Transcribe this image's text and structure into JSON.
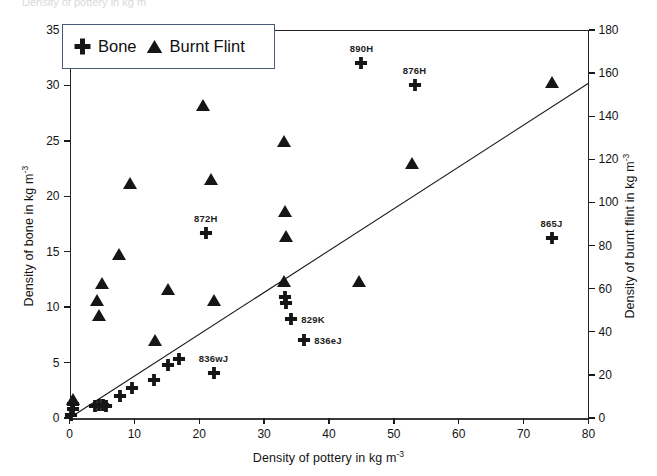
{
  "figure": {
    "ghost_text": "Density of pottery in kg m",
    "background": "#ffffff",
    "ink_color": "#161616",
    "legend_border_color": "#4a5a78"
  },
  "legend": {
    "position": "top-left-inside",
    "entries": [
      {
        "label": "Bone",
        "marker": "cross",
        "icon_name": "cross-marker-icon"
      },
      {
        "label": "Burnt Flint",
        "marker": "triangle",
        "icon_name": "triangle-marker-icon"
      }
    ]
  },
  "chart_data": {
    "type": "scatter",
    "title": "",
    "xlabel": "Density of pottery in kg m",
    "xlabel_exponent": "-3",
    "ylabel": "Density of bone in kg m",
    "ylabel_exponent": "-3",
    "ylabel_right": "Density of burnt flint in kg m",
    "ylabel_right_exponent": "-3",
    "grid": false,
    "xlim": [
      0,
      80
    ],
    "ylim": [
      0,
      35
    ],
    "ylim_right": [
      0,
      180
    ],
    "xticks": [
      0,
      10,
      20,
      30,
      40,
      50,
      60,
      70,
      80
    ],
    "yticks_left": [
      0,
      5,
      10,
      15,
      20,
      25,
      30,
      35
    ],
    "yticks_right": [
      0,
      20,
      40,
      60,
      80,
      100,
      120,
      140,
      160,
      180
    ],
    "legend_position": "upper left",
    "series": [
      {
        "name": "Bone",
        "marker": "cross",
        "axis": "left",
        "points": [
          {
            "x": 0.3,
            "y": 0.3
          },
          {
            "x": 0.5,
            "y": 0.8
          },
          {
            "x": 0.6,
            "y": 1.3
          },
          {
            "x": 4.0,
            "y": 1.1
          },
          {
            "x": 4.6,
            "y": 1.2
          },
          {
            "x": 5.2,
            "y": 1.2
          },
          {
            "x": 5.6,
            "y": 1.1
          },
          {
            "x": 7.8,
            "y": 2.0
          },
          {
            "x": 9.7,
            "y": 2.7
          },
          {
            "x": 13.0,
            "y": 3.4
          },
          {
            "x": 15.2,
            "y": 4.8
          },
          {
            "x": 16.9,
            "y": 5.3
          },
          {
            "x": 21.0,
            "y": 16.7,
            "label": "872H"
          },
          {
            "x": 22.2,
            "y": 4.1,
            "label": "836wJ"
          },
          {
            "x": 33.2,
            "y": 10.9
          },
          {
            "x": 33.4,
            "y": 10.4
          },
          {
            "x": 34.2,
            "y": 8.9,
            "label": "829K"
          },
          {
            "x": 36.2,
            "y": 7.0,
            "label": "836eJ"
          },
          {
            "x": 45.0,
            "y": 32.0,
            "label": "890H"
          },
          {
            "x": 53.2,
            "y": 30.0,
            "label": "876H"
          },
          {
            "x": 74.3,
            "y": 16.2,
            "label": "865J"
          }
        ]
      },
      {
        "name": "Burnt Flint",
        "marker": "triangle",
        "axis": "right",
        "points": [
          {
            "x": 0.6,
            "y": 1.7,
            "y_right": 8.7
          },
          {
            "x": 4.2,
            "y": 10.6,
            "y_right": 54.5
          },
          {
            "x": 4.6,
            "y": 9.3,
            "y_right": 47.8
          },
          {
            "x": 5.0,
            "y": 12.2,
            "y_right": 62.7
          },
          {
            "x": 7.6,
            "y": 14.8,
            "y_right": 76.1
          },
          {
            "x": 9.4,
            "y": 21.2,
            "y_right": 109.0
          },
          {
            "x": 13.2,
            "y": 7.0,
            "y_right": 36.0
          },
          {
            "x": 15.2,
            "y": 11.6,
            "y_right": 59.7
          },
          {
            "x": 20.6,
            "y": 28.2,
            "y_right": 145.0
          },
          {
            "x": 21.8,
            "y": 21.6,
            "y_right": 111.1
          },
          {
            "x": 22.2,
            "y": 10.6,
            "y_right": 54.5
          },
          {
            "x": 33.0,
            "y": 25.0,
            "y_right": 128.6
          },
          {
            "x": 33.2,
            "y": 18.7,
            "y_right": 96.2
          },
          {
            "x": 33.4,
            "y": 16.4,
            "y_right": 84.3
          },
          {
            "x": 33.0,
            "y": 12.4,
            "y_right": 63.8
          },
          {
            "x": 44.6,
            "y": 12.4,
            "y_right": 63.8
          },
          {
            "x": 52.8,
            "y": 23.0,
            "y_right": 118.3
          },
          {
            "x": 74.4,
            "y": 30.3,
            "y_right": 155.8
          }
        ]
      }
    ],
    "trendline": {
      "x_start": 0.0,
      "y_start": 0.0,
      "x_end": 80.0,
      "y_end": 30.2,
      "style": "solid"
    }
  }
}
